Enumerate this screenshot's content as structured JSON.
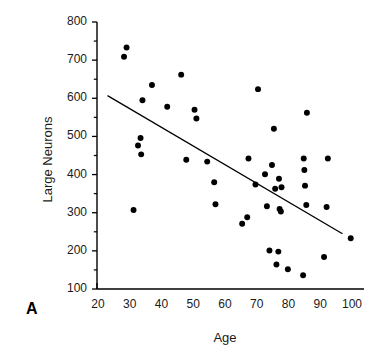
{
  "figure": {
    "panel_letter": "A",
    "background_color": "#ffffff",
    "ink_color": "#000000"
  },
  "chart_data": {
    "type": "scatter",
    "title": "",
    "xlabel": "Age",
    "ylabel": "Large Neurons",
    "xlim": [
      20,
      100
    ],
    "ylim": [
      100,
      800
    ],
    "grid": false,
    "legend": null,
    "xticks": [
      20,
      30,
      40,
      50,
      60,
      70,
      80,
      90,
      100
    ],
    "yticks": [
      100,
      200,
      300,
      400,
      500,
      600,
      700,
      800
    ],
    "y_minor_tick_step": 50,
    "marker": {
      "shape": "circle",
      "color": "#000000",
      "size": 4.6
    },
    "points": [
      {
        "x": 28.2,
        "y": 709
      },
      {
        "x": 29.0,
        "y": 733
      },
      {
        "x": 31.2,
        "y": 307
      },
      {
        "x": 32.6,
        "y": 476
      },
      {
        "x": 33.4,
        "y": 496
      },
      {
        "x": 33.6,
        "y": 453
      },
      {
        "x": 34.0,
        "y": 595
      },
      {
        "x": 37.0,
        "y": 635
      },
      {
        "x": 41.8,
        "y": 578
      },
      {
        "x": 46.2,
        "y": 662
      },
      {
        "x": 47.8,
        "y": 439
      },
      {
        "x": 50.4,
        "y": 570
      },
      {
        "x": 51.0,
        "y": 547
      },
      {
        "x": 54.4,
        "y": 434
      },
      {
        "x": 56.6,
        "y": 380
      },
      {
        "x": 57.0,
        "y": 322
      },
      {
        "x": 65.4,
        "y": 271
      },
      {
        "x": 67.0,
        "y": 288
      },
      {
        "x": 67.4,
        "y": 442
      },
      {
        "x": 69.6,
        "y": 374
      },
      {
        "x": 70.4,
        "y": 624
      },
      {
        "x": 72.6,
        "y": 401
      },
      {
        "x": 73.2,
        "y": 317
      },
      {
        "x": 74.0,
        "y": 201
      },
      {
        "x": 74.8,
        "y": 425
      },
      {
        "x": 75.4,
        "y": 520
      },
      {
        "x": 75.8,
        "y": 363
      },
      {
        "x": 76.2,
        "y": 164
      },
      {
        "x": 76.8,
        "y": 198
      },
      {
        "x": 77.0,
        "y": 389
      },
      {
        "x": 77.2,
        "y": 310
      },
      {
        "x": 77.6,
        "y": 303
      },
      {
        "x": 77.8,
        "y": 367
      },
      {
        "x": 79.8,
        "y": 152
      },
      {
        "x": 84.6,
        "y": 136
      },
      {
        "x": 84.8,
        "y": 442
      },
      {
        "x": 85.0,
        "y": 412
      },
      {
        "x": 85.2,
        "y": 371
      },
      {
        "x": 85.6,
        "y": 320
      },
      {
        "x": 85.8,
        "y": 562
      },
      {
        "x": 91.2,
        "y": 184
      },
      {
        "x": 92.0,
        "y": 315
      },
      {
        "x": 92.4,
        "y": 442
      },
      {
        "x": 99.6,
        "y": 233
      }
    ],
    "trendline": {
      "type": "linear-fit",
      "x_start": 23.0,
      "y_start": 607,
      "x_end": 97.0,
      "y_end": 245,
      "color": "#000000",
      "width": 1.3
    },
    "annotations": [
      {
        "text": "A",
        "role": "panel-label"
      }
    ]
  }
}
